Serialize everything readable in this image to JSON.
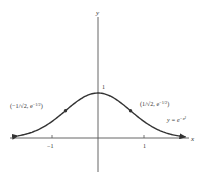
{
  "chart_data": {
    "type": "line",
    "title": "",
    "function": "y = e^{-x^2}",
    "xlabel": "x",
    "ylabel": "y",
    "xlim": [
      -2.1,
      2.0
    ],
    "ylim": [
      -0.75,
      2.9
    ],
    "x_ticks": [
      {
        "value": -1,
        "label": "−1"
      },
      {
        "value": 1,
        "label": "1"
      }
    ],
    "y_ticks": [
      {
        "value": 1,
        "label": "1"
      }
    ],
    "grid": false,
    "legend": null,
    "series": [
      {
        "name": "y = e^{-x²}",
        "x": [
          -1.74,
          -1.5,
          -1.25,
          -1.0,
          -0.75,
          -0.5,
          -0.25,
          0,
          0.25,
          0.5,
          0.75,
          1.0,
          1.25,
          1.5,
          1.9
        ],
        "y": [
          0.048,
          0.105,
          0.21,
          0.368,
          0.57,
          0.779,
          0.939,
          1.0,
          0.939,
          0.779,
          0.57,
          0.368,
          0.21,
          0.105,
          0.027
        ],
        "arrows": "both-ends"
      }
    ],
    "marked_points": [
      {
        "x": -0.7071,
        "y": 0.6065,
        "label_main": "(−1/√2, e",
        "label_exp": "−1/2",
        "label_close": ")"
      },
      {
        "x": 0.7071,
        "y": 0.6065,
        "label_main": "(1/√2, e",
        "label_exp": "−1/2",
        "label_close": ")"
      }
    ],
    "annotations": [
      {
        "text_main": "y = e",
        "text_exp": "−x²",
        "near": "right tail"
      }
    ]
  }
}
